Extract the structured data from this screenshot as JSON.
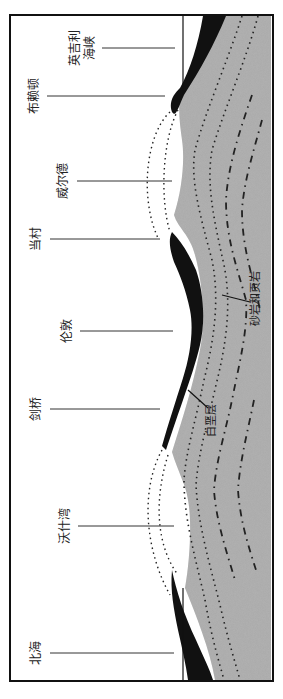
{
  "figure": {
    "title": "",
    "orientation": "rotated-90",
    "colors": {
      "background": "#ffffff",
      "bedrock_fill": "#a9a9a9",
      "chalk_fill": "#111111",
      "frame": "#111111",
      "leader": "#333333"
    }
  },
  "locations": [
    {
      "id": "yingjili-haixia",
      "label_line1": "英吉利",
      "label_line2": "海峡"
    },
    {
      "id": "buladun",
      "label_line1": "布赖顿",
      "label_line2": ""
    },
    {
      "id": "weierde",
      "label_line1": "威尔德",
      "label_line2": ""
    },
    {
      "id": "dangcun",
      "label_line1": "当村",
      "label_line2": ""
    },
    {
      "id": "lundun",
      "label_line1": "伦敦",
      "label_line2": ""
    },
    {
      "id": "jianqiao",
      "label_line1": "剑桥",
      "label_line2": ""
    },
    {
      "id": "woshiwan",
      "label_line1": "沃什湾",
      "label_line2": ""
    },
    {
      "id": "beihai",
      "label_line1": "北海",
      "label_line2": ""
    }
  ],
  "strata_labels": {
    "chalk": "白垩层",
    "sandstone_shale": "砂岩和页岩"
  },
  "legend_line_styles": [
    {
      "name": "eroded-fold-outline",
      "style": "dotted"
    },
    {
      "name": "strata-boundary",
      "style": "dotted"
    },
    {
      "name": "strata-boundary-dashed",
      "style": "dash-dot"
    }
  ]
}
